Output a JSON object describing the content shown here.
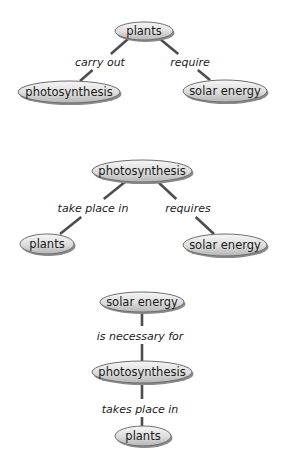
{
  "colors": {
    "background": "#ffffff",
    "edge": "#4d4d4d",
    "node_fill_light": "#f4f4f4",
    "node_fill_dark": "#b9b9b9",
    "node_stroke": "#6e6e6e",
    "text": "#1a1a1a"
  },
  "maps": [
    {
      "name": "map-plants-root",
      "nodes": [
        {
          "id": "plants",
          "label": "plants",
          "cx": 144,
          "cy": 31,
          "rx": 29,
          "ry": 9
        },
        {
          "id": "photosynthesis",
          "label": "photosynthesis",
          "cx": 69,
          "cy": 92,
          "rx": 51,
          "ry": 11
        },
        {
          "id": "solar-energy",
          "label": "solar energy",
          "cx": 225,
          "cy": 91,
          "rx": 42,
          "ry": 11
        }
      ],
      "links": [
        {
          "from": "plants",
          "to": "photosynthesis",
          "label": "carry out",
          "lx": 100,
          "ly": 62,
          "x1": 128,
          "y1": 39,
          "x2": 80,
          "y2": 81,
          "gap1": 54,
          "gap2": 70
        },
        {
          "from": "plants",
          "to": "solar-energy",
          "label": "require",
          "lx": 190,
          "ly": 62,
          "x1": 160,
          "y1": 39,
          "x2": 210,
          "y2": 80,
          "gap1": 54,
          "gap2": 70
        }
      ]
    },
    {
      "name": "map-photosynthesis-root",
      "nodes": [
        {
          "id": "photosynthesis",
          "label": "photosynthesis",
          "cx": 142,
          "cy": 171,
          "rx": 50,
          "ry": 11
        },
        {
          "id": "plants",
          "label": "plants",
          "cx": 47,
          "cy": 244,
          "rx": 27,
          "ry": 10
        },
        {
          "id": "solar-energy",
          "label": "solar energy",
          "cx": 225,
          "cy": 245,
          "rx": 42,
          "ry": 11
        }
      ],
      "links": [
        {
          "from": "photosynthesis",
          "to": "plants",
          "label": "take place in",
          "lx": 93,
          "ly": 208,
          "x1": 125,
          "y1": 182,
          "x2": 60,
          "y2": 234,
          "gap1": 199,
          "gap2": 217
        },
        {
          "from": "photosynthesis",
          "to": "solar-energy",
          "label": "requires",
          "lx": 188,
          "ly": 208,
          "x1": 158,
          "y1": 182,
          "x2": 214,
          "y2": 234,
          "gap1": 199,
          "gap2": 217
        }
      ]
    },
    {
      "name": "map-solar-energy-root",
      "nodes": [
        {
          "id": "solar-energy",
          "label": "solar energy",
          "cx": 142,
          "cy": 302,
          "rx": 42,
          "ry": 10
        },
        {
          "id": "photosynthesis",
          "label": "photosynthesis",
          "cx": 142,
          "cy": 372,
          "rx": 50,
          "ry": 11
        },
        {
          "id": "plants",
          "label": "plants",
          "cx": 143,
          "cy": 436,
          "rx": 28,
          "ry": 10
        }
      ],
      "links": [
        {
          "from": "solar-energy",
          "to": "photosynthesis",
          "label": "is necessary for",
          "lx": 140,
          "ly": 336,
          "x1": 142,
          "y1": 312,
          "x2": 142,
          "y2": 361,
          "gap1": 326,
          "gap2": 344
        },
        {
          "from": "photosynthesis",
          "to": "plants",
          "label": "takes place in",
          "lx": 140,
          "ly": 409,
          "x1": 142,
          "y1": 383,
          "x2": 142,
          "y2": 426,
          "gap1": 399,
          "gap2": 417
        }
      ]
    }
  ]
}
